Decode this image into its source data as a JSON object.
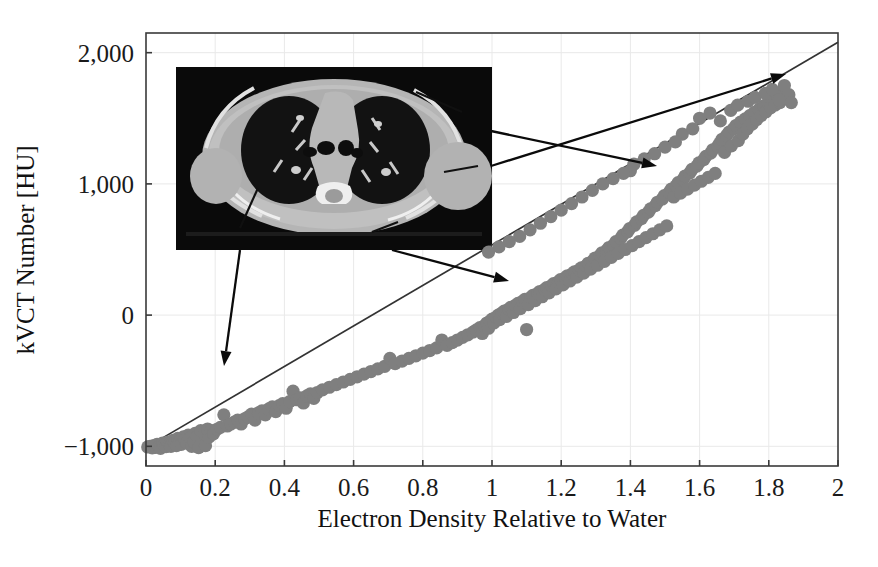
{
  "figure": {
    "name": "kvct-number-vs-electron-density-calibration-plot",
    "inset": {
      "name": "ct-chest-axial-slice",
      "description": "Axial CT slice of human thorax showing lungs, mediastinum, ribs and soft tissue",
      "x": 176,
      "y": 67,
      "width": 316,
      "height": 183
    },
    "annotations": [
      {
        "name": "arrow-lung-to-low-density-points",
        "from": [
          240,
          250
        ],
        "to": [
          224,
          366
        ]
      },
      {
        "name": "arrow-soft-tissue-to-mid-points",
        "from": [
          392,
          250
        ],
        "to": [
          509,
          281
        ]
      },
      {
        "name": "arrow-bone-to-high-points",
        "from": [
          491,
          131
        ],
        "to": [
          657,
          166
        ]
      },
      {
        "name": "arrow-dense-bone-to-top-points",
        "from": [
          491,
          166
        ],
        "to": [
          786,
          74
        ]
      }
    ]
  },
  "chart_data": {
    "type": "scatter",
    "title": "",
    "xlabel": "Electron Density Relative to Water",
    "ylabel": "kVCT Number [HU]",
    "xlim": [
      0,
      2
    ],
    "ylim": [
      -1150,
      2150
    ],
    "xticks": [
      0,
      0.2,
      0.4,
      0.6,
      0.8,
      1,
      1.2,
      1.4,
      1.6,
      1.8,
      2
    ],
    "xticklabels": [
      "0",
      "0.2",
      "0.4",
      "0.6",
      "0.8",
      "1",
      "1.2",
      "1.4",
      "1.6",
      "1.8",
      "2"
    ],
    "yticks": [
      -1000,
      0,
      1000,
      2000
    ],
    "yticklabels": [
      "−1,000",
      "0",
      "1,000",
      "2,000"
    ],
    "grid": true,
    "legend": false,
    "point_color": "#7f7f7f",
    "line_color": "#333333",
    "series": [
      {
        "name": "Stoichiometric calibration fit",
        "type": "line",
        "x": [
          0.0,
          2.0
        ],
        "y": [
          -1010,
          2080
        ]
      },
      {
        "name": "Measured tissue samples",
        "type": "scatter",
        "points": [
          [
            0.005,
            -1005
          ],
          [
            0.012,
            -1000
          ],
          [
            0.018,
            -1012
          ],
          [
            0.022,
            -995
          ],
          [
            0.028,
            -1008
          ],
          [
            0.032,
            -985
          ],
          [
            0.038,
            -1000
          ],
          [
            0.042,
            -1015
          ],
          [
            0.048,
            -975
          ],
          [
            0.052,
            -990
          ],
          [
            0.058,
            -1002
          ],
          [
            0.062,
            -968
          ],
          [
            0.068,
            -985
          ],
          [
            0.072,
            -1000
          ],
          [
            0.078,
            -955
          ],
          [
            0.082,
            -972
          ],
          [
            0.088,
            -995
          ],
          [
            0.092,
            -940
          ],
          [
            0.098,
            -962
          ],
          [
            0.102,
            -985
          ],
          [
            0.108,
            -928
          ],
          [
            0.112,
            -950
          ],
          [
            0.118,
            -975
          ],
          [
            0.122,
            -915
          ],
          [
            0.128,
            -938
          ],
          [
            0.132,
            -1000
          ],
          [
            0.138,
            -965
          ],
          [
            0.142,
            -902
          ],
          [
            0.148,
            -925
          ],
          [
            0.152,
            -1010
          ],
          [
            0.158,
            -880
          ],
          [
            0.162,
            -955
          ],
          [
            0.168,
            -905
          ],
          [
            0.172,
            -995
          ],
          [
            0.178,
            -868
          ],
          [
            0.182,
            -930
          ],
          [
            0.188,
            -880
          ],
          [
            0.195,
            -905
          ],
          [
            0.205,
            -870
          ],
          [
            0.215,
            -855
          ],
          [
            0.225,
            -760
          ],
          [
            0.235,
            -845
          ],
          [
            0.245,
            -830
          ],
          [
            0.255,
            -815
          ],
          [
            0.265,
            -800
          ],
          [
            0.275,
            -830
          ],
          [
            0.285,
            -790
          ],
          [
            0.295,
            -775
          ],
          [
            0.305,
            -755
          ],
          [
            0.315,
            -800
          ],
          [
            0.325,
            -745
          ],
          [
            0.335,
            -730
          ],
          [
            0.345,
            -760
          ],
          [
            0.355,
            -715
          ],
          [
            0.365,
            -700
          ],
          [
            0.375,
            -735
          ],
          [
            0.385,
            -690
          ],
          [
            0.395,
            -675
          ],
          [
            0.405,
            -710
          ],
          [
            0.415,
            -660
          ],
          [
            0.425,
            -580
          ],
          [
            0.435,
            -645
          ],
          [
            0.445,
            -630
          ],
          [
            0.455,
            -670
          ],
          [
            0.465,
            -615
          ],
          [
            0.475,
            -600
          ],
          [
            0.485,
            -635
          ],
          [
            0.495,
            -590
          ],
          [
            0.51,
            -570
          ],
          [
            0.53,
            -550
          ],
          [
            0.55,
            -530
          ],
          [
            0.57,
            -510
          ],
          [
            0.59,
            -490
          ],
          [
            0.61,
            -470
          ],
          [
            0.63,
            -450
          ],
          [
            0.65,
            -430
          ],
          [
            0.67,
            -410
          ],
          [
            0.69,
            -390
          ],
          [
            0.705,
            -330
          ],
          [
            0.72,
            -370
          ],
          [
            0.74,
            -350
          ],
          [
            0.76,
            -330
          ],
          [
            0.78,
            -310
          ],
          [
            0.8,
            -290
          ],
          [
            0.82,
            -270
          ],
          [
            0.84,
            -250
          ],
          [
            0.855,
            -190
          ],
          [
            0.87,
            -230
          ],
          [
            0.885,
            -210
          ],
          [
            0.9,
            -190
          ],
          [
            0.915,
            -170
          ],
          [
            0.93,
            -150
          ],
          [
            0.945,
            -130
          ],
          [
            0.955,
            -112
          ],
          [
            0.965,
            -95
          ],
          [
            0.972,
            -140
          ],
          [
            0.978,
            -80
          ],
          [
            0.985,
            -60
          ],
          [
            0.99,
            -100
          ],
          [
            0.995,
            -45
          ],
          [
            1.0,
            -30
          ],
          [
            1.005,
            -60
          ],
          [
            1.012,
            -15
          ],
          [
            1.018,
            0
          ],
          [
            1.022,
            -35
          ],
          [
            1.028,
            15
          ],
          [
            1.035,
            30
          ],
          [
            1.042,
            -10
          ],
          [
            1.048,
            45
          ],
          [
            1.055,
            60
          ],
          [
            1.062,
            20
          ],
          [
            1.068,
            75
          ],
          [
            1.075,
            90
          ],
          [
            1.082,
            50
          ],
          [
            1.088,
            105
          ],
          [
            1.095,
            120
          ],
          [
            1.1,
            -110
          ],
          [
            1.105,
            80
          ],
          [
            1.112,
            135
          ],
          [
            1.118,
            150
          ],
          [
            1.125,
            110
          ],
          [
            1.132,
            165
          ],
          [
            1.138,
            180
          ],
          [
            1.145,
            140
          ],
          [
            1.152,
            195
          ],
          [
            1.158,
            210
          ],
          [
            1.165,
            170
          ],
          [
            1.172,
            225
          ],
          [
            1.178,
            240
          ],
          [
            1.185,
            200
          ],
          [
            1.192,
            255
          ],
          [
            1.198,
            270
          ],
          [
            1.205,
            230
          ],
          [
            1.212,
            285
          ],
          [
            1.218,
            300
          ],
          [
            1.225,
            260
          ],
          [
            1.232,
            315
          ],
          [
            1.238,
            330
          ],
          [
            1.245,
            290
          ],
          [
            1.252,
            345
          ],
          [
            1.258,
            360
          ],
          [
            1.265,
            320
          ],
          [
            1.272,
            375
          ],
          [
            1.278,
            395
          ],
          [
            1.285,
            350
          ],
          [
            1.292,
            415
          ],
          [
            1.298,
            435
          ],
          [
            1.305,
            380
          ],
          [
            1.312,
            455
          ],
          [
            1.318,
            475
          ],
          [
            1.325,
            410
          ],
          [
            1.332,
            495
          ],
          [
            1.338,
            515
          ],
          [
            1.345,
            440
          ],
          [
            1.352,
            535
          ],
          [
            1.358,
            560
          ],
          [
            1.365,
            470
          ],
          [
            1.372,
            585
          ],
          [
            1.378,
            610
          ],
          [
            1.385,
            500
          ],
          [
            1.392,
            635
          ],
          [
            1.398,
            660
          ],
          [
            1.405,
            530
          ],
          [
            1.412,
            685
          ],
          [
            1.4,
            1100
          ],
          [
            1.418,
            710
          ],
          [
            1.425,
            560
          ],
          [
            1.432,
            735
          ],
          [
            1.438,
            760
          ],
          [
            1.445,
            590
          ],
          [
            1.452,
            785
          ],
          [
            1.458,
            810
          ],
          [
            1.465,
            620
          ],
          [
            1.472,
            835
          ],
          [
            1.478,
            860
          ],
          [
            1.485,
            650
          ],
          [
            1.492,
            885
          ],
          [
            1.498,
            910
          ],
          [
            1.505,
            680
          ],
          [
            1.512,
            935
          ],
          [
            1.518,
            960
          ],
          [
            1.525,
            900
          ],
          [
            1.532,
            985
          ],
          [
            1.538,
            1010
          ],
          [
            1.545,
            930
          ],
          [
            1.552,
            1035
          ],
          [
            1.558,
            1060
          ],
          [
            1.565,
            960
          ],
          [
            1.572,
            1085
          ],
          [
            1.578,
            1110
          ],
          [
            1.585,
            990
          ],
          [
            1.592,
            1135
          ],
          [
            1.598,
            1160
          ],
          [
            1.605,
            1020
          ],
          [
            1.612,
            1185
          ],
          [
            1.618,
            1210
          ],
          [
            1.625,
            1050
          ],
          [
            1.632,
            1235
          ],
          [
            1.638,
            1260
          ],
          [
            1.645,
            1080
          ],
          [
            1.652,
            1285
          ],
          [
            1.658,
            1310
          ],
          [
            1.665,
            1340
          ],
          [
            1.672,
            1240
          ],
          [
            1.678,
            1370
          ],
          [
            1.685,
            1395
          ],
          [
            1.692,
            1290
          ],
          [
            1.698,
            1420
          ],
          [
            1.705,
            1445
          ],
          [
            1.712,
            1330
          ],
          [
            1.718,
            1470
          ],
          [
            1.725,
            1380
          ],
          [
            1.732,
            1495
          ],
          [
            1.738,
            1420
          ],
          [
            1.745,
            1520
          ],
          [
            1.752,
            1455
          ],
          [
            1.758,
            1545
          ],
          [
            1.765,
            1490
          ],
          [
            1.772,
            1570
          ],
          [
            1.778,
            1520
          ],
          [
            1.785,
            1595
          ],
          [
            1.792,
            1550
          ],
          [
            1.798,
            1620
          ],
          [
            1.805,
            1580
          ],
          [
            1.812,
            1645
          ],
          [
            1.818,
            1600
          ],
          [
            1.825,
            1670
          ],
          [
            1.832,
            1620
          ],
          [
            1.838,
            1700
          ],
          [
            1.845,
            1750
          ],
          [
            1.852,
            1650
          ],
          [
            1.858,
            1680
          ],
          [
            1.865,
            1620
          ],
          [
            1.6,
            1500
          ],
          [
            1.63,
            1540
          ],
          [
            1.66,
            1480
          ],
          [
            1.69,
            1560
          ],
          [
            1.71,
            1600
          ],
          [
            1.74,
            1630
          ],
          [
            1.76,
            1660
          ],
          [
            1.79,
            1690
          ],
          [
            1.81,
            1720
          ],
          [
            1.83,
            1640
          ],
          [
            1.55,
            1380
          ],
          [
            1.58,
            1420
          ],
          [
            1.5,
            1280
          ],
          [
            1.53,
            1320
          ],
          [
            1.47,
            1230
          ],
          [
            1.44,
            1190
          ],
          [
            1.41,
            1150
          ],
          [
            1.38,
            1080
          ],
          [
            1.35,
            1040
          ],
          [
            1.32,
            1000
          ],
          [
            1.29,
            950
          ],
          [
            1.26,
            900
          ],
          [
            1.23,
            850
          ],
          [
            1.2,
            800
          ],
          [
            1.17,
            750
          ],
          [
            1.14,
            700
          ],
          [
            1.11,
            650
          ],
          [
            1.08,
            600
          ],
          [
            1.05,
            560
          ],
          [
            1.02,
            520
          ],
          [
            0.99,
            480
          ]
        ]
      }
    ]
  }
}
